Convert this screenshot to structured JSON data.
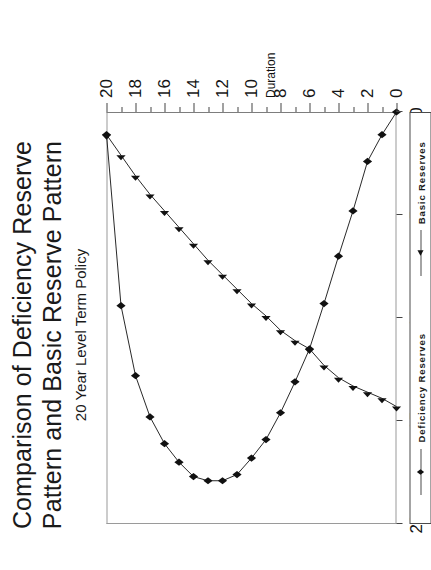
{
  "title": {
    "line1": "Comparison of Deficiency Reserve",
    "line2": "Pattern and Basic Reserve Pattern",
    "subtitle": "20 Year Level Term Policy"
  },
  "legend": {
    "items": [
      {
        "label": "Deficiency Reserves",
        "marker": "diamond",
        "color": "#111111"
      },
      {
        "label": "Basic Reserves",
        "marker": "triangle",
        "color": "#111111"
      }
    ]
  },
  "chart_data": {
    "type": "line",
    "title": "Comparison of Deficiency Reserve Pattern and Basic Reserve Pattern",
    "subtitle": "20 Year Level Term Policy",
    "xlabel": "Duration",
    "ylabel": "",
    "xlim": [
      0,
      20
    ],
    "ylim": [
      0,
      20
    ],
    "xticks": [
      0,
      2,
      4,
      6,
      8,
      10,
      12,
      14,
      16,
      18,
      20
    ],
    "xtick_labels": [
      "0",
      "2",
      "4",
      "6",
      "8",
      "10",
      "12",
      "14",
      "16",
      "18",
      "20"
    ],
    "x_minor_step": 1,
    "yticks": [
      0,
      5,
      10,
      15,
      20
    ],
    "ytick_labels": [
      "0",
      "5",
      "10",
      "15",
      "20"
    ],
    "grid": false,
    "legend_position": "bottom",
    "x": [
      0,
      1,
      2,
      3,
      4,
      5,
      6,
      7,
      8,
      9,
      10,
      11,
      12,
      13,
      14,
      15,
      16,
      17,
      18,
      19,
      20
    ],
    "series": [
      {
        "name": "Deficiency Reserves",
        "marker": "diamond",
        "color": "#111111",
        "values": [
          0.0,
          1.1,
          2.4,
          4.8,
          7.0,
          9.3,
          11.5,
          13.1,
          14.6,
          15.9,
          16.8,
          17.6,
          17.9,
          17.9,
          17.7,
          17.0,
          16.1,
          14.8,
          12.8,
          9.4,
          1.1
        ]
      },
      {
        "name": "Basic Reserves",
        "marker": "triangle",
        "color": "#111111",
        "values": [
          14.3,
          13.9,
          13.6,
          13.3,
          12.9,
          12.3,
          11.5,
          11.1,
          10.6,
          9.9,
          9.3,
          8.6,
          7.9,
          7.2,
          6.4,
          5.6,
          4.8,
          4.0,
          3.1,
          2.1,
          1.1
        ]
      }
    ]
  }
}
